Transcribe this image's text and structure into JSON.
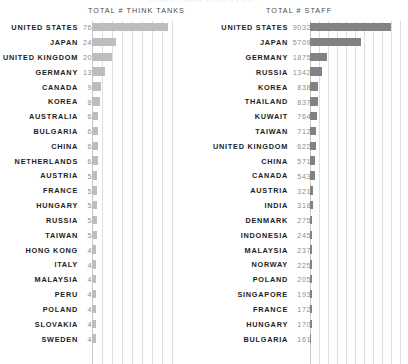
{
  "top_clipped_text": "THINK TANK DIRECTORY",
  "colors": {
    "left_bar": "#bdbdbd",
    "right_bar": "#828282",
    "gridline": "#dedede",
    "label": "#1d1d1d",
    "value": "#8e8e8e",
    "header": "#4a4a4a",
    "background": "#ffffff"
  },
  "chart_data": [
    {
      "type": "bar",
      "orientation": "horizontal",
      "title": "TOTAL # THINK TANKS",
      "xlabel": "",
      "ylabel": "",
      "xlim": [
        0,
        88
      ],
      "grid": true,
      "gridline_step": 10,
      "legend": "none",
      "bar_color": "#bdbdbd",
      "categories": [
        "UNITED STATES",
        "JAPAN",
        "UNITED KINGDOM",
        "GERMANY",
        "CANADA",
        "KOREA",
        "AUSTRALIA",
        "BULGARIA",
        "CHINA",
        "NETHERLANDS",
        "AUSTRIA",
        "FRANCE",
        "HUNGARY",
        "RUSSIA",
        "TAIWAN",
        "HONG KONG",
        "ITALY",
        "MALAYSIA",
        "PERU",
        "POLAND",
        "SLOVAKIA",
        "SWEDEN"
      ],
      "values": [
        76,
        24,
        20,
        13,
        9,
        8,
        6,
        6,
        6,
        6,
        5,
        5,
        5,
        5,
        5,
        4,
        4,
        4,
        4,
        4,
        4,
        4
      ]
    },
    {
      "type": "bar",
      "orientation": "horizontal",
      "title": "TOTAL # STAFF",
      "xlabel": "",
      "ylabel": "",
      "xlim": [
        0,
        10000
      ],
      "grid": true,
      "gridline_step": 1000,
      "legend": "none",
      "bar_color": "#828282",
      "categories": [
        "UNITED STATES",
        "JAPAN",
        "GERMANY",
        "RUSSIA",
        "KOREA",
        "THAILAND",
        "KUWAIT",
        "TAIWAN",
        "UNITED KINGDOM",
        "CHINA",
        "CANADA",
        "AUSTRIA",
        "INDIA",
        "DENMARK",
        "INDONESIA",
        "MALAYSIA",
        "NORWAY",
        "POLAND",
        "SINGAPORE",
        "FRANCE",
        "HUNGARY",
        "BULGARIA"
      ],
      "values": [
        9032,
        5709,
        1875,
        1342,
        838,
        837,
        764,
        712,
        622,
        571,
        543,
        321,
        318,
        275,
        245,
        237,
        225,
        205,
        193,
        172,
        170,
        161
      ]
    }
  ]
}
